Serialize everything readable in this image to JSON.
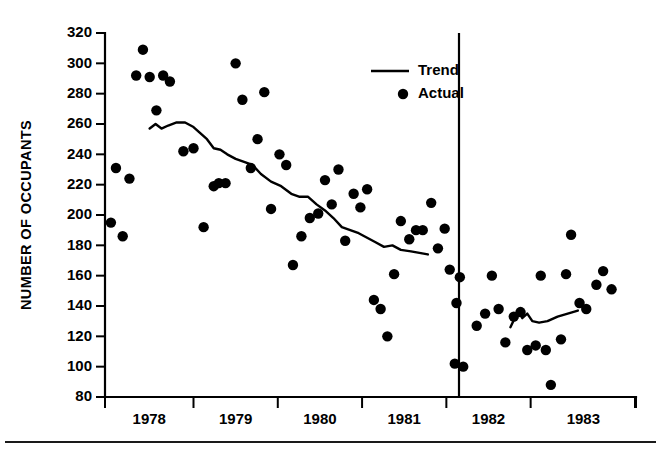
{
  "chart_data": {
    "type": "scatter",
    "title": "",
    "xlabel": "",
    "ylabel": "NUMBER OF OCCUPANTS",
    "ylim": [
      80,
      320
    ],
    "xlim": [
      1977.45,
      1983.75
    ],
    "grid": false,
    "legend_position": "top-right",
    "y_ticks": [
      80,
      100,
      120,
      140,
      160,
      180,
      200,
      220,
      240,
      260,
      280,
      300,
      320
    ],
    "x_ticks": [
      1978,
      1979,
      1980,
      1981,
      1982,
      1983
    ],
    "x_tick_labels": [
      "1978",
      "1979",
      "1980",
      "1981",
      "1982",
      "1983"
    ],
    "annotations": [
      {
        "name": "intervention-divider",
        "type": "vertical-line",
        "x": 1981.65,
        "label": ""
      }
    ],
    "series": [
      {
        "name": "Actual",
        "marker": "filled-circle",
        "color": "#000000",
        "points": [
          [
            1977.52,
            195
          ],
          [
            1977.58,
            231
          ],
          [
            1977.66,
            186
          ],
          [
            1977.74,
            224
          ],
          [
            1977.82,
            292
          ],
          [
            1977.9,
            309
          ],
          [
            1977.98,
            291
          ],
          [
            1978.06,
            269
          ],
          [
            1978.14,
            292
          ],
          [
            1978.22,
            288
          ],
          [
            1978.38,
            242
          ],
          [
            1978.5,
            244
          ],
          [
            1978.62,
            192
          ],
          [
            1978.74,
            219
          ],
          [
            1978.8,
            221
          ],
          [
            1978.88,
            221
          ],
          [
            1979.0,
            300
          ],
          [
            1979.08,
            276
          ],
          [
            1979.18,
            231
          ],
          [
            1979.26,
            250
          ],
          [
            1979.34,
            281
          ],
          [
            1979.42,
            204
          ],
          [
            1979.52,
            240
          ],
          [
            1979.6,
            233
          ],
          [
            1979.68,
            167
          ],
          [
            1979.78,
            186
          ],
          [
            1979.88,
            198
          ],
          [
            1979.98,
            201
          ],
          [
            1980.06,
            223
          ],
          [
            1980.14,
            207
          ],
          [
            1980.22,
            230
          ],
          [
            1980.3,
            183
          ],
          [
            1980.4,
            214
          ],
          [
            1980.48,
            205
          ],
          [
            1980.56,
            217
          ],
          [
            1980.64,
            144
          ],
          [
            1980.72,
            138
          ],
          [
            1980.8,
            120
          ],
          [
            1980.88,
            161
          ],
          [
            1980.96,
            196
          ],
          [
            1981.06,
            184
          ],
          [
            1981.14,
            190
          ],
          [
            1981.22,
            190
          ],
          [
            1981.32,
            208
          ],
          [
            1981.4,
            178
          ],
          [
            1981.48,
            191
          ],
          [
            1981.54,
            164
          ],
          [
            1981.62,
            142
          ],
          [
            1981.66,
            159
          ],
          [
            1981.6,
            102
          ],
          [
            1981.7,
            100
          ],
          [
            1981.86,
            127
          ],
          [
            1981.96,
            135
          ],
          [
            1982.04,
            160
          ],
          [
            1982.12,
            138
          ],
          [
            1982.2,
            116
          ],
          [
            1982.3,
            133
          ],
          [
            1982.38,
            136
          ],
          [
            1982.46,
            111
          ],
          [
            1982.56,
            114
          ],
          [
            1982.62,
            160
          ],
          [
            1982.68,
            111
          ],
          [
            1982.74,
            88
          ],
          [
            1982.86,
            118
          ],
          [
            1982.92,
            161
          ],
          [
            1982.98,
            187
          ],
          [
            1983.08,
            142
          ],
          [
            1983.16,
            138
          ],
          [
            1983.28,
            154
          ],
          [
            1983.36,
            163
          ],
          [
            1983.46,
            151
          ]
        ]
      },
      {
        "name": "Trend",
        "marker": "line",
        "color": "#000000",
        "points": [
          [
            1977.98,
            257
          ],
          [
            1978.05,
            260
          ],
          [
            1978.12,
            257
          ],
          [
            1978.2,
            259
          ],
          [
            1978.3,
            261
          ],
          [
            1978.4,
            261
          ],
          [
            1978.5,
            258
          ],
          [
            1978.58,
            254
          ],
          [
            1978.66,
            250
          ],
          [
            1978.74,
            244
          ],
          [
            1978.82,
            243
          ],
          [
            1978.9,
            240
          ],
          [
            1979.0,
            237
          ],
          [
            1979.1,
            235
          ],
          [
            1979.2,
            233
          ],
          [
            1979.3,
            227
          ],
          [
            1979.42,
            222
          ],
          [
            1979.54,
            219
          ],
          [
            1979.66,
            214
          ],
          [
            1979.76,
            212
          ],
          [
            1979.86,
            212
          ],
          [
            1979.96,
            207
          ],
          [
            1980.06,
            203
          ],
          [
            1980.16,
            198
          ],
          [
            1980.26,
            192
          ],
          [
            1980.36,
            190
          ],
          [
            1980.46,
            188
          ],
          [
            1980.56,
            185
          ],
          [
            1980.66,
            182
          ],
          [
            1980.76,
            179
          ],
          [
            1980.86,
            180
          ],
          [
            1980.96,
            177
          ],
          [
            1981.08,
            176
          ],
          [
            1981.18,
            175
          ],
          [
            1981.28,
            174
          ],
          [
            1982.26,
            126
          ],
          [
            1982.32,
            133
          ],
          [
            1982.36,
            137
          ],
          [
            1982.4,
            132
          ],
          [
            1982.46,
            135
          ],
          [
            1982.52,
            130
          ],
          [
            1982.6,
            129
          ],
          [
            1982.7,
            130
          ],
          [
            1982.82,
            133
          ],
          [
            1282.94,
            135
          ],
          [
            1983.06,
            137
          ]
        ]
      }
    ],
    "legend": [
      {
        "label": "Trend",
        "marker": "line"
      },
      {
        "label": "Actual",
        "marker": "filled-circle"
      }
    ]
  }
}
